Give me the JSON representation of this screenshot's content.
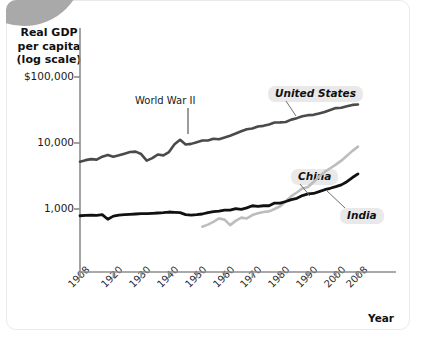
{
  "figure": {
    "y_axis_title_lines": [
      "Real GDP",
      "per capita",
      "(log scale)"
    ],
    "x_axis_title": "Year"
  },
  "chart_data": {
    "type": "line",
    "title": "",
    "subtitle": "",
    "xlabel": "Year",
    "ylabel": "Real GDP per capita (log scale)",
    "y_scale": "log",
    "ylim": [
      300,
      200000
    ],
    "xlim": [
      1908,
      2008
    ],
    "grid": false,
    "legend_position": "inline-annotations",
    "y_ticks": [
      {
        "value": 1000,
        "label": "1,000"
      },
      {
        "value": 10000,
        "label": "10,000"
      },
      {
        "value": 100000,
        "label": "$100,000"
      }
    ],
    "x_ticks": [
      {
        "value": 1908,
        "label": "1908"
      },
      {
        "value": 1920,
        "label": "1920"
      },
      {
        "value": 1930,
        "label": "1930"
      },
      {
        "value": 1940,
        "label": "1940"
      },
      {
        "value": 1950,
        "label": "1950"
      },
      {
        "value": 1960,
        "label": "1960"
      },
      {
        "value": 1970,
        "label": "1970"
      },
      {
        "value": 1980,
        "label": "1980"
      },
      {
        "value": 1990,
        "label": "1990"
      },
      {
        "value": 2000,
        "label": "2000"
      },
      {
        "value": 2008,
        "label": "2008"
      }
    ],
    "annotations": [
      {
        "text": "World War II",
        "x": 1942,
        "y": 13500,
        "note": "points to US wartime spike"
      }
    ],
    "series": [
      {
        "name": "United States",
        "label": "United States",
        "color": "#4a4a4a",
        "linewidth": 2.6,
        "x": [
          1908,
          1910,
          1912,
          1914,
          1916,
          1918,
          1920,
          1922,
          1924,
          1926,
          1928,
          1930,
          1932,
          1934,
          1936,
          1938,
          1940,
          1942,
          1944,
          1946,
          1948,
          1950,
          1952,
          1954,
          1956,
          1958,
          1960,
          1962,
          1964,
          1966,
          1968,
          1970,
          1972,
          1974,
          1976,
          1978,
          1980,
          1982,
          1984,
          1986,
          1988,
          1990,
          1992,
          1994,
          1996,
          1998,
          2000,
          2002,
          2004,
          2006,
          2008
        ],
        "values": [
          5200,
          5500,
          5700,
          5600,
          6200,
          6600,
          6200,
          6500,
          6900,
          7300,
          7400,
          6800,
          5400,
          5900,
          6700,
          6500,
          7300,
          9600,
          11200,
          9500,
          9700,
          10300,
          10900,
          10900,
          11600,
          11400,
          12100,
          12900,
          13900,
          15100,
          16200,
          16600,
          17800,
          18200,
          19100,
          20400,
          20500,
          20800,
          22600,
          23800,
          25500,
          26400,
          26700,
          28100,
          29500,
          31700,
          33800,
          34200,
          36000,
          37800,
          38400
        ]
      },
      {
        "name": "China",
        "label": "China",
        "color": "#bdbdbd",
        "linewidth": 2.6,
        "x": [
          1952,
          1954,
          1956,
          1958,
          1960,
          1962,
          1964,
          1966,
          1968,
          1970,
          1972,
          1974,
          1976,
          1978,
          1980,
          1982,
          1984,
          1986,
          1988,
          1990,
          1992,
          1994,
          1996,
          1998,
          2000,
          2002,
          2004,
          2006,
          2008
        ],
        "values": [
          540,
          580,
          640,
          720,
          690,
          570,
          660,
          740,
          720,
          810,
          860,
          900,
          920,
          1000,
          1100,
          1300,
          1570,
          1780,
          2050,
          2160,
          2560,
          3100,
          3650,
          4150,
          4700,
          5400,
          6400,
          7600,
          8800
        ]
      },
      {
        "name": "India",
        "label": "India",
        "color": "#111111",
        "linewidth": 2.8,
        "x": [
          1908,
          1910,
          1912,
          1914,
          1916,
          1918,
          1920,
          1922,
          1924,
          1926,
          1928,
          1930,
          1932,
          1934,
          1936,
          1938,
          1940,
          1942,
          1944,
          1946,
          1948,
          1950,
          1952,
          1954,
          1956,
          1958,
          1960,
          1962,
          1964,
          1966,
          1968,
          1970,
          1972,
          1974,
          1976,
          1978,
          1980,
          1982,
          1984,
          1986,
          1988,
          1990,
          1992,
          1994,
          1996,
          1998,
          2000,
          2002,
          2004,
          2006,
          2008
        ],
        "values": [
          790,
          800,
          810,
          800,
          820,
          700,
          780,
          810,
          820,
          830,
          840,
          850,
          850,
          860,
          870,
          880,
          900,
          890,
          880,
          820,
          810,
          820,
          840,
          880,
          910,
          930,
          960,
          960,
          1010,
          990,
          1040,
          1120,
          1100,
          1120,
          1120,
          1230,
          1230,
          1300,
          1390,
          1450,
          1600,
          1690,
          1720,
          1830,
          1960,
          2060,
          2180,
          2320,
          2590,
          3000,
          3400
        ]
      }
    ]
  }
}
